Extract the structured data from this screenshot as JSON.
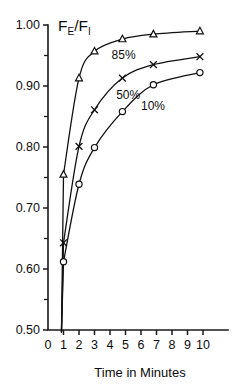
{
  "chart_data": {
    "type": "line",
    "title": "",
    "subtitle": "",
    "xlabel": "Time in Minutes",
    "ylabel": "FE/FI",
    "ylabel_parts": {
      "f1": "F",
      "sub1": "E",
      "slash": "/",
      "f2": "F",
      "sub2": "I"
    },
    "xlim": [
      0,
      10
    ],
    "ylim": [
      0.5,
      1.0
    ],
    "grid": false,
    "legend_position": "inline-annotations",
    "x_ticks": [
      0,
      1,
      2,
      3,
      4,
      5,
      6,
      7,
      8,
      9,
      10
    ],
    "x_tick_labels": [
      "0",
      "1",
      "2",
      "3",
      "4",
      "5",
      "6",
      "7",
      "8",
      "9",
      "10"
    ],
    "y_ticks_major": [
      0.5,
      0.6,
      0.7,
      0.8,
      0.9,
      1.0
    ],
    "y_tick_labels": [
      "0.50",
      "0.60",
      "0.70",
      "0.80",
      "0.90",
      "1.00"
    ],
    "y_ticks_minor": [
      0.55,
      0.65,
      0.75,
      0.85,
      0.95
    ],
    "series": [
      {
        "name": "85%",
        "label": "85%",
        "marker": "triangle",
        "label_x": 4.1,
        "label_y": 0.944,
        "x": [
          1,
          2,
          3,
          4.8,
          6.8,
          9.8
        ],
        "values": [
          0.755,
          0.913,
          0.957,
          0.977,
          0.985,
          0.99
        ]
      },
      {
        "name": "50%",
        "label": "50%",
        "marker": "x",
        "label_x": 4.4,
        "label_y": 0.878,
        "x": [
          1,
          2,
          3,
          4.8,
          6.8,
          9.8
        ],
        "values": [
          0.643,
          0.801,
          0.861,
          0.913,
          0.935,
          0.948
        ]
      },
      {
        "name": "10%",
        "label": "10%",
        "marker": "circle",
        "label_x": 6.0,
        "label_y": 0.86,
        "x": [
          1,
          2,
          3,
          4.8,
          6.8,
          9.8
        ],
        "values": [
          0.612,
          0.739,
          0.799,
          0.858,
          0.902,
          0.922
        ]
      }
    ]
  }
}
